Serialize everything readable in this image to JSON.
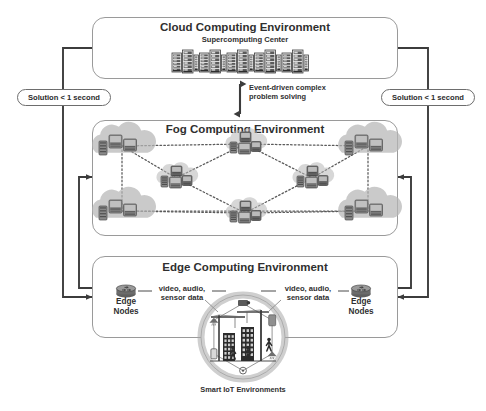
{
  "diagram": {
    "title_hidden": "",
    "layers": [
      {
        "id": "cloud",
        "title": "Cloud Computing Environment",
        "subtitle": "Supercomputing Center",
        "icon": "server-rack-icon",
        "rack_groups": 5
      },
      {
        "id": "fog",
        "title": "Fog Computing Environment",
        "icon": "fog-cloud-node-icon",
        "node_count": 8
      },
      {
        "id": "edge",
        "title": "Edge Computing Environment",
        "icon": "router-icon"
      }
    ],
    "center_arrow": {
      "name": "event-driven-arrow",
      "label_line1": "Event-driven complex",
      "label_line2": "problem solving",
      "direction": "bidirectional"
    },
    "latency_badges": [
      {
        "id": "left",
        "label": "Solution < 1 second"
      },
      {
        "id": "right",
        "label": "Solution < 1 second"
      }
    ],
    "edge_nodes": [
      {
        "id": "left",
        "line1": "Edge",
        "line2": "Nodes"
      },
      {
        "id": "right",
        "line1": "Edge",
        "line2": "Nodes"
      }
    ],
    "data_flows": [
      {
        "id": "left",
        "line1": "video, audio,",
        "line2": "sensor data"
      },
      {
        "id": "right",
        "line1": "video, audio,",
        "line2": "sensor data"
      }
    ],
    "iot": {
      "caption": "Smart IoT Environments",
      "scene": "construction-site-icon"
    },
    "colors": {
      "panel_border": "#9a9a9a",
      "arrow": "#3c3c3c",
      "text": "#2f2f2f",
      "node_fill": "#8d8d8d",
      "node_dark": "#5e5e5e",
      "cloud_fill": "#b6b6b6",
      "dotted": "#5a5a5a",
      "iot_ring": "#a8a8a8"
    }
  }
}
